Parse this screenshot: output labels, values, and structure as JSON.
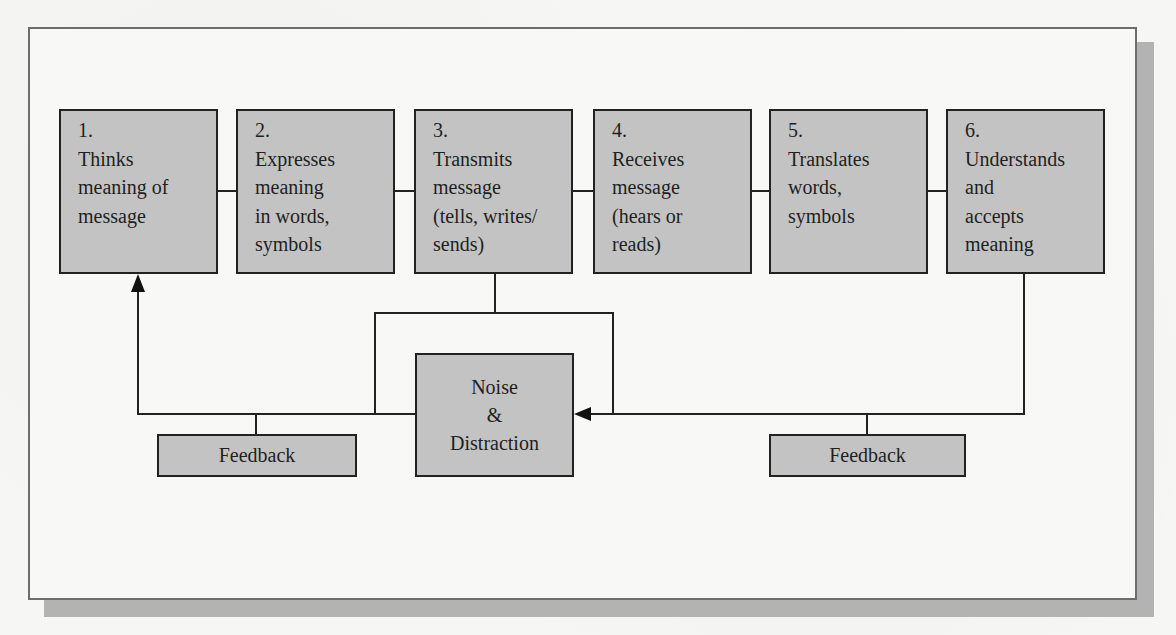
{
  "diagram": {
    "title": "",
    "steps": [
      {
        "number": "1.",
        "lines": [
          "Thinks",
          "meaning of",
          "message"
        ]
      },
      {
        "number": "2.",
        "lines": [
          "Expresses",
          "meaning",
          "in words,",
          "symbols"
        ]
      },
      {
        "number": "3.",
        "lines": [
          "Transmits",
          "message",
          "(tells, writes/",
          "sends)"
        ]
      },
      {
        "number": "4.",
        "lines": [
          "Receives",
          "message",
          "(hears or",
          "reads)"
        ]
      },
      {
        "number": "5.",
        "lines": [
          "Translates",
          "words,",
          "symbols"
        ]
      },
      {
        "number": "6.",
        "lines": [
          "Understands",
          "and",
          "accepts",
          "meaning"
        ]
      }
    ],
    "noise": {
      "lines": [
        "Noise",
        "&",
        "Distraction"
      ]
    },
    "feedback_left": {
      "label": "Feedback"
    },
    "feedback_right": {
      "label": "Feedback"
    },
    "colors": {
      "box_fill": "#c3c3c3",
      "box_border": "#222222",
      "frame_border": "#6d6d6d",
      "frame_shadow": "#b3b3b3",
      "background": "#f6f6f4"
    }
  }
}
